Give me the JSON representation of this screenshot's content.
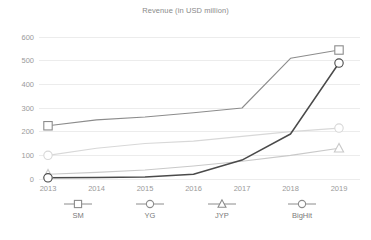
{
  "chart_data": {
    "type": "line",
    "title": "Revenue (in USD million)",
    "xlabel": "",
    "ylabel": "",
    "categories": [
      "2013",
      "2014",
      "2015",
      "2016",
      "2017",
      "2018",
      "2019"
    ],
    "x": [
      2013,
      2014,
      2015,
      2016,
      2017,
      2018,
      2019
    ],
    "xlim": [
      2013,
      2019
    ],
    "ylim": [
      0,
      600
    ],
    "yticks": [
      0,
      100,
      200,
      300,
      400,
      500,
      600
    ],
    "ytick_labels": [
      "0",
      "100",
      "200",
      "300",
      "400",
      "500",
      "600"
    ],
    "grid": true,
    "legend_position": "bottom",
    "series": [
      {
        "name": "SM",
        "marker": "square",
        "color": "#8c8c8c",
        "values": [
          225,
          250,
          262,
          280,
          300,
          510,
          545
        ]
      },
      {
        "name": "YG",
        "marker": "circle",
        "color": "#d8d8d8",
        "values": [
          100,
          130,
          150,
          160,
          180,
          200,
          215
        ]
      },
      {
        "name": "JYP",
        "marker": "triangle",
        "color": "#c9c9c9",
        "values": [
          20,
          28,
          38,
          55,
          75,
          100,
          130
        ]
      },
      {
        "name": "BigHit",
        "marker": "circle",
        "color": "#4a4a4a",
        "values": [
          5,
          6,
          8,
          20,
          80,
          190,
          490
        ]
      }
    ]
  },
  "legend": {
    "entries": [
      {
        "label": "SM",
        "marker": "square",
        "color": "#8c8c8c"
      },
      {
        "label": "YG",
        "marker": "circle",
        "color": "#8c8c8c"
      },
      {
        "label": "JYP",
        "marker": "triangle",
        "color": "#8c8c8c"
      },
      {
        "label": "BigHit",
        "marker": "circle",
        "color": "#8c8c8c"
      }
    ]
  },
  "colors": {
    "background": "#ffffff",
    "grid": "#ececec",
    "tick_text": "#9a9a9a",
    "title_text": "#8a8a8a"
  }
}
